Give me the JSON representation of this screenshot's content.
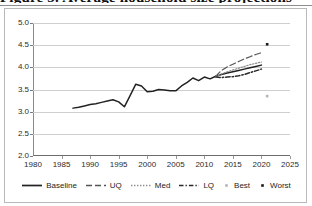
{
  "title_sliver": "Figure 3. Average household size projections",
  "chart_data": {
    "type": "line",
    "title": "",
    "xlabel": "",
    "ylabel": "",
    "xlim": [
      1980,
      2025
    ],
    "ylim": [
      2.0,
      5.0
    ],
    "grid": true,
    "legend_position": "bottom",
    "x_ticks": [
      "1980",
      "1985",
      "1990",
      "1995",
      "2000",
      "2005",
      "2010",
      "2015",
      "2020",
      "2025"
    ],
    "y_ticks": [
      "2.0",
      "2.5",
      "3.0",
      "3.5",
      "4.0",
      "4.5",
      "5.0"
    ],
    "series": [
      {
        "name": "Baseline",
        "style": "solid",
        "color": "#222222",
        "points": [
          [
            1987,
            3.08
          ],
          [
            1988,
            3.1
          ],
          [
            1989,
            3.13
          ],
          [
            1990,
            3.16
          ],
          [
            1991,
            3.18
          ],
          [
            1992,
            3.21
          ],
          [
            1993,
            3.24
          ],
          [
            1994,
            3.27
          ],
          [
            1995,
            3.22
          ],
          [
            1996,
            3.11
          ],
          [
            1997,
            3.36
          ],
          [
            1998,
            3.62
          ],
          [
            1999,
            3.58
          ],
          [
            2000,
            3.45
          ],
          [
            2001,
            3.46
          ],
          [
            2002,
            3.5
          ],
          [
            2003,
            3.49
          ],
          [
            2004,
            3.47
          ],
          [
            2005,
            3.47
          ],
          [
            2006,
            3.58
          ],
          [
            2007,
            3.66
          ],
          [
            2008,
            3.76
          ],
          [
            2009,
            3.7
          ],
          [
            2010,
            3.78
          ],
          [
            2011,
            3.74
          ],
          [
            2012,
            3.8
          ],
          [
            2013,
            3.84
          ],
          [
            2014,
            3.87
          ],
          [
            2015,
            3.9
          ],
          [
            2016,
            3.93
          ],
          [
            2017,
            3.96
          ],
          [
            2018,
            3.99
          ],
          [
            2019,
            4.02
          ],
          [
            2020,
            4.05
          ]
        ]
      },
      {
        "name": "UQ",
        "style": "dashed",
        "color": "#555555",
        "points": [
          [
            2012,
            3.8
          ],
          [
            2013,
            3.93
          ],
          [
            2014,
            4.01
          ],
          [
            2015,
            4.07
          ],
          [
            2016,
            4.13
          ],
          [
            2017,
            4.19
          ],
          [
            2018,
            4.24
          ],
          [
            2019,
            4.29
          ],
          [
            2020,
            4.33
          ]
        ]
      },
      {
        "name": "Med",
        "style": "dotted",
        "color": "#8c8c8c",
        "points": [
          [
            2012,
            3.79
          ],
          [
            2013,
            3.85
          ],
          [
            2014,
            3.9
          ],
          [
            2015,
            3.94
          ],
          [
            2016,
            3.98
          ],
          [
            2017,
            4.02
          ],
          [
            2018,
            4.06
          ],
          [
            2019,
            4.09
          ],
          [
            2020,
            4.12
          ]
        ]
      },
      {
        "name": "LQ",
        "style": "dashdot",
        "color": "#2b2b2b",
        "points": [
          [
            2012,
            3.78
          ],
          [
            2013,
            3.77
          ],
          [
            2014,
            3.78
          ],
          [
            2015,
            3.79
          ],
          [
            2016,
            3.81
          ],
          [
            2017,
            3.84
          ],
          [
            2018,
            3.88
          ],
          [
            2019,
            3.92
          ],
          [
            2020,
            3.96
          ]
        ]
      },
      {
        "name": "Best",
        "style": "marker",
        "color": "#b5b5b5",
        "points": [
          [
            2021,
            3.35
          ]
        ]
      },
      {
        "name": "Worst",
        "style": "marker",
        "color": "#1a1a1a",
        "points": [
          [
            2021,
            4.52
          ]
        ]
      }
    ],
    "legend": [
      {
        "label": "Baseline",
        "key": "solid-line",
        "color": "#222222"
      },
      {
        "label": "UQ",
        "key": "dashed-line",
        "color": "#555555"
      },
      {
        "label": "Med",
        "key": "dotted-line",
        "color": "#8c8c8c"
      },
      {
        "label": "LQ",
        "key": "dashdot-line",
        "color": "#2b2b2b"
      },
      {
        "label": "Best",
        "key": "dot-marker",
        "color": "#b5b5b5"
      },
      {
        "label": "Worst",
        "key": "dot-marker",
        "color": "#1a1a1a"
      }
    ]
  }
}
